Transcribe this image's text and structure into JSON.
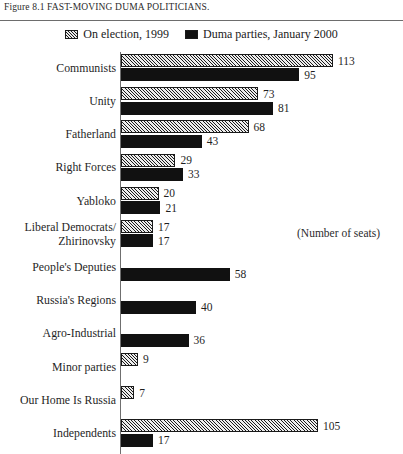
{
  "figure": {
    "caption": "Figure 8.1 FAST-MOVING DUMA POLITICIANS.",
    "annotation": "(Number of seats)"
  },
  "legend": {
    "entries": [
      {
        "label": "On election, 1999",
        "swatch": "hatched-swatch"
      },
      {
        "label": "Duma parties, January 2000",
        "swatch": "solid-swatch"
      }
    ]
  },
  "colors": {
    "bar_solid": "#111111",
    "bar_hatch_background": "#d8d8d8",
    "hatch_line": "#1a1a1a",
    "axis": "#6f6f6f",
    "rule": "#6d6d6d",
    "text": "#1f1f1f"
  },
  "chart_data": {
    "type": "bar",
    "orientation": "horizontal",
    "title": "Figure 8.1 FAST-MOVING DUMA POLITICIANS.",
    "xlabel": "(Number of seats)",
    "ylabel": "",
    "xlim": [
      0,
      113
    ],
    "grid": false,
    "legend_position": "top-center",
    "categories": [
      "Communists",
      "Unity",
      "Fatherland",
      "Right Forces",
      "Yabloko",
      "Liberal Democrats/ Zhirinovsky",
      "People's Deputies",
      "Russia's Regions",
      "Agro-Industrial",
      "Minor parties",
      "Our Home Is Russia",
      "Independents"
    ],
    "series": [
      {
        "name": "On election, 1999",
        "values": [
          113,
          73,
          68,
          29,
          20,
          17,
          null,
          null,
          null,
          9,
          7,
          105
        ]
      },
      {
        "name": "Duma parties, January 2000",
        "values": [
          95,
          81,
          43,
          33,
          21,
          17,
          58,
          40,
          36,
          null,
          null,
          17
        ]
      }
    ]
  },
  "rows": [
    {
      "label_line1": "Communists",
      "label_line2": "",
      "first": "113",
      "second": "95"
    },
    {
      "label_line1": "Unity",
      "label_line2": "",
      "first": "73",
      "second": "81"
    },
    {
      "label_line1": "Fatherland",
      "label_line2": "",
      "first": "68",
      "second": "43"
    },
    {
      "label_line1": "Right Forces",
      "label_line2": "",
      "first": "29",
      "second": "33"
    },
    {
      "label_line1": "Yabloko",
      "label_line2": "",
      "first": "20",
      "second": "21"
    },
    {
      "label_line1": "Liberal Democrats/",
      "label_line2": "Zhirinovsky",
      "first": "17",
      "second": "17"
    },
    {
      "label_line1": "People's Deputies",
      "label_line2": "",
      "first": "",
      "second": "58"
    },
    {
      "label_line1": "Russia's Regions",
      "label_line2": "",
      "first": "",
      "second": "40"
    },
    {
      "label_line1": "Agro-Industrial",
      "label_line2": "",
      "first": "",
      "second": "36"
    },
    {
      "label_line1": "Minor parties",
      "label_line2": "",
      "first": "9",
      "second": ""
    },
    {
      "label_line1": "Our Home Is Russia",
      "label_line2": "",
      "first": "7",
      "second": ""
    },
    {
      "label_line1": "Independents",
      "label_line2": "",
      "first": "105",
      "second": "17"
    }
  ]
}
